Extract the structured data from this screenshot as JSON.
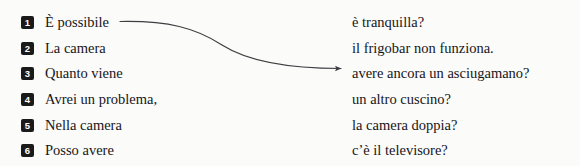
{
  "exercise": {
    "rows": [
      {
        "number": "1",
        "left": "È possibile",
        "right": "è tranquilla?"
      },
      {
        "number": "2",
        "left": "La camera",
        "right": "il frigobar non funziona."
      },
      {
        "number": "3",
        "left": "Quanto viene",
        "right": "avere ancora un asciugamano?"
      },
      {
        "number": "4",
        "left": "Avrei un problema,",
        "right": "un altro cuscino?"
      },
      {
        "number": "5",
        "left": "Nella camera",
        "right": "la camera doppia?"
      },
      {
        "number": "6",
        "left": "Posso avere",
        "right": "c’è il televisore?"
      }
    ],
    "connector": {
      "label": "match-line-row1-to-row3",
      "from_row": "1",
      "to_row": "3",
      "color": "#3d3d44"
    },
    "colors": {
      "background": "#fbfbf9",
      "text": "#16161a",
      "badge_background": "#1a1a1a",
      "badge_text": "#ffffff"
    }
  }
}
